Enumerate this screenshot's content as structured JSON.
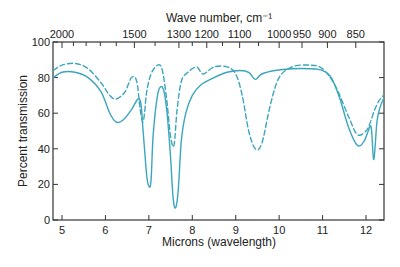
{
  "chart_data": {
    "type": "line",
    "title": "",
    "xlabel": "Microns (wavelength)",
    "ylabel": "Percent transmission",
    "x2label": "Wave number, cm⁻¹",
    "xlim": [
      4.8,
      12.4
    ],
    "ylim": [
      0,
      100
    ],
    "grid": false,
    "legend": null,
    "x_ticks": [
      5,
      6,
      7,
      8,
      9,
      10,
      11,
      12
    ],
    "x_tick_labels": [
      "5",
      "6",
      "7",
      "8",
      "9",
      "10",
      "11",
      "12"
    ],
    "y_ticks": [
      0,
      20,
      40,
      60,
      80,
      100
    ],
    "y_tick_labels": [
      "0",
      "20",
      "40",
      "60",
      "80",
      "100"
    ],
    "x2_ticks_cm": [
      2000,
      1500,
      1300,
      1200,
      1100,
      1000,
      950,
      900,
      850
    ],
    "x2_tick_labels": [
      "2000",
      "1500",
      "1300",
      "1200",
      "1100",
      "1000",
      "950",
      "900",
      "850"
    ],
    "x2_minor_ticks_cm": [
      1900,
      1800,
      1700,
      1600,
      1400,
      1250,
      1150,
      1050
    ],
    "series": [
      {
        "name": "solid",
        "style": "solid",
        "color": "#3aa6bd",
        "x": [
          4.8,
          5.0,
          5.3,
          5.6,
          5.9,
          6.1,
          6.25,
          6.4,
          6.6,
          6.75,
          6.82,
          6.86,
          6.9,
          6.95,
          7.0,
          7.05,
          7.1,
          7.2,
          7.28,
          7.35,
          7.42,
          7.5,
          7.56,
          7.62,
          7.68,
          7.75,
          7.85,
          8.0,
          8.2,
          8.5,
          8.8,
          9.1,
          9.3,
          9.45,
          9.6,
          9.9,
          10.3,
          10.7,
          11.0,
          11.2,
          11.4,
          11.6,
          11.8,
          11.95,
          12.05,
          12.12,
          12.18,
          12.25,
          12.32,
          12.4
        ],
        "y": [
          80,
          83,
          83,
          80,
          72,
          60,
          55,
          56,
          62,
          68,
          65,
          52,
          40,
          25,
          19,
          22,
          48,
          70,
          75,
          72,
          60,
          35,
          12,
          7,
          18,
          45,
          60,
          70,
          76,
          80,
          83,
          84,
          83,
          79,
          82,
          84,
          85,
          85,
          84,
          80,
          68,
          52,
          42,
          44,
          50,
          52,
          34,
          55,
          63,
          68
        ]
      },
      {
        "name": "dashed",
        "style": "dashed",
        "color": "#3aa6bd",
        "x": [
          4.8,
          5.0,
          5.3,
          5.6,
          5.9,
          6.1,
          6.25,
          6.45,
          6.6,
          6.72,
          6.8,
          6.86,
          6.9,
          6.95,
          7.05,
          7.2,
          7.3,
          7.4,
          7.5,
          7.58,
          7.65,
          7.75,
          7.9,
          8.1,
          8.25,
          8.5,
          8.8,
          9.0,
          9.15,
          9.3,
          9.45,
          9.6,
          9.8,
          10.0,
          10.3,
          10.7,
          11.0,
          11.3,
          11.6,
          11.8,
          12.0,
          12.1,
          12.2,
          12.3,
          12.4
        ],
        "y": [
          84,
          87,
          88,
          85,
          77,
          70,
          68,
          72,
          80,
          78,
          62,
          55,
          60,
          72,
          82,
          87,
          85,
          70,
          47,
          42,
          62,
          78,
          83,
          86,
          82,
          86,
          86,
          82,
          70,
          50,
          40,
          43,
          65,
          80,
          86,
          87,
          85,
          75,
          58,
          48,
          50,
          55,
          62,
          67,
          70
        ]
      }
    ]
  }
}
